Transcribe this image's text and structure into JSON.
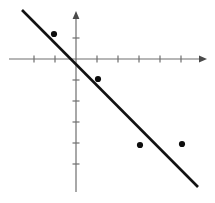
{
  "figure": {
    "title": "",
    "background_color": "#ffffff",
    "width": 215,
    "height": 203
  },
  "chart_data": {
    "type": "scatter",
    "title": "",
    "subtitle": "",
    "xlabel": "",
    "ylabel": "",
    "grid": false,
    "legend": null,
    "axis_style": "arrowed-cartesian-axes",
    "origin_px": {
      "x": 76,
      "y": 59
    },
    "tick_spacing_px": 21,
    "xlim": [
      -3.2,
      6.2
    ],
    "ylim": [
      -7.0,
      2.3
    ],
    "xticks": [
      -2,
      -1,
      1,
      2,
      3,
      4,
      5
    ],
    "yticks": [
      1,
      -1,
      -2,
      -3,
      -4,
      -5
    ],
    "xtick_labels": [
      "",
      "",
      "",
      "",
      "",
      "",
      ""
    ],
    "ytick_labels": [
      "",
      "",
      "",
      "",
      "",
      ""
    ],
    "points": [
      {
        "label": "P1",
        "x": -1.05,
        "y": 1.19
      },
      {
        "label": "P2",
        "x": 1.05,
        "y": -0.95
      },
      {
        "label": "P3",
        "x": 3.05,
        "y": -4.1
      },
      {
        "label": "P4",
        "x": 5.05,
        "y": -4.05
      }
    ],
    "series": [
      {
        "name": "data-points",
        "type": "scatter",
        "marker": "filled-circle",
        "color": "#0d0d0d",
        "x": [
          -1.05,
          1.05,
          3.05,
          5.05
        ],
        "y": [
          1.19,
          -0.95,
          -4.1,
          -4.05
        ]
      },
      {
        "name": "trend-line",
        "type": "line",
        "color": "#121212",
        "slope": -1.0,
        "intercept": -0.29,
        "x_endpoints": [
          -2.57,
          5.81
        ],
        "y_endpoints": [
          2.33,
          -6.1
        ]
      }
    ],
    "annotations": []
  },
  "axes": {
    "x_axis": {
      "name": "x-axis",
      "start_px": {
        "x": 9,
        "y": 59
      },
      "end_px": {
        "x": 207,
        "y": 59
      },
      "arrow": "right",
      "color": "#6e6e6e",
      "tick_positions_px": [
        34,
        55,
        97,
        118,
        139,
        160,
        181
      ],
      "tick_length_px": 7
    },
    "y_axis": {
      "name": "y-axis",
      "start_px": {
        "x": 76,
        "y": 11
      },
      "end_px": {
        "x": 76,
        "y": 192
      },
      "arrow": "up",
      "color": "#6e6e6e",
      "tick_positions_px": [
        38,
        80,
        101,
        122,
        143,
        164
      ],
      "tick_length_px": 7
    }
  },
  "markers": {
    "radius_px": 3.1,
    "positions_px": [
      {
        "x": 54,
        "y": 34
      },
      {
        "x": 98,
        "y": 79
      },
      {
        "x": 140,
        "y": 145
      },
      {
        "x": 182,
        "y": 144
      }
    ]
  },
  "line": {
    "start_px": {
      "x": 22,
      "y": 10
    },
    "end_px": {
      "x": 198,
      "y": 187
    },
    "width_px": 2.6,
    "color": "#121212"
  }
}
